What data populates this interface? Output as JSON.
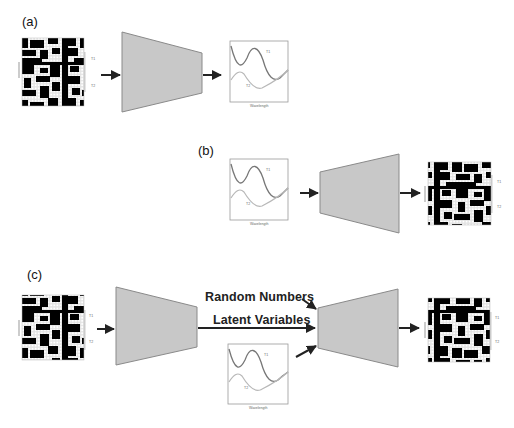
{
  "panels": {
    "a": {
      "label": "(a)",
      "description": "Structure grid -> encoder network -> spectra plot"
    },
    "b": {
      "label": "(b)",
      "description": "Spectra plot -> network -> structure grid"
    },
    "c": {
      "label": "(c)",
      "description": "Structure grid -> encoder -> latent variables + random numbers + spectra -> decoder -> structure grid"
    }
  },
  "annotations": {
    "random_numbers": "Random Numbers",
    "latent_variables": "Latent Variables"
  },
  "plot": {
    "xlabel": "Wavelength",
    "curve_1_label": "T1",
    "curve_2_label": "T2"
  },
  "grid": {
    "ylabel": "Input",
    "side_label_1": "T1",
    "side_label_2": "T2"
  },
  "colors": {
    "trapezoid_fill": "#c8c8c8",
    "trapezoid_stroke": "#8a8a8a",
    "arrow": "#222222",
    "grid_bg": "#000000",
    "grid_dot": "#e6e6e6",
    "curve_dark": "#777777",
    "curve_light": "#b8b8b8"
  }
}
